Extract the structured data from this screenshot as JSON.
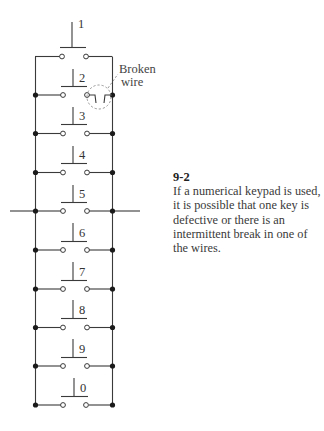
{
  "figure": {
    "number": "9-2",
    "caption": "If a numerical keypad is used, it is possible that one key is defective or there is an intermittent break in one of the wires.",
    "annotation": {
      "line1": "Broken",
      "line2": "wire"
    },
    "keys": [
      "1",
      "2",
      "3",
      "4",
      "5",
      "6",
      "7",
      "8",
      "9",
      "0"
    ],
    "colors": {
      "wire": "#3a3a3a",
      "node": "#1a1a1a",
      "dashed": "#8a8a8a",
      "text": "#3a3a3a"
    }
  }
}
